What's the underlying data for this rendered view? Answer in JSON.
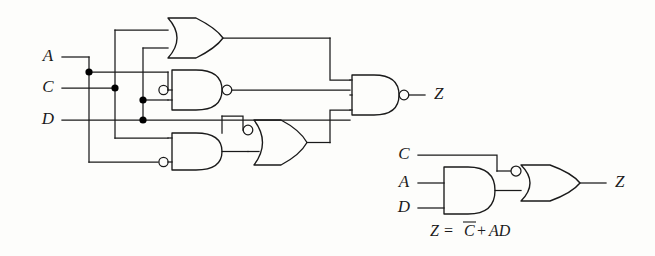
{
  "figure": {
    "kind": "logic-circuit-diagram",
    "background_color": "#fdfdfb",
    "line_color": "#1a1a1a",
    "width": 655,
    "height": 256
  },
  "left_circuit": {
    "name": "nand-nor-implementation",
    "inputs": [
      {
        "id": "A",
        "label": "A",
        "x": 48,
        "y": 57
      },
      {
        "id": "C",
        "label": "C",
        "x": 48,
        "y": 88
      },
      {
        "id": "D",
        "label": "D",
        "x": 48,
        "y": 120
      }
    ],
    "output": {
      "id": "Z",
      "label": "Z",
      "x": 432,
      "y": 95
    },
    "gates": [
      {
        "id": "g1",
        "type": "OR",
        "inputs": 2,
        "inverted_inputs": [],
        "inverted_output": false
      },
      {
        "id": "g2",
        "type": "AND",
        "inputs": 3,
        "inverted_inputs": [
          0
        ],
        "inverted_output": true
      },
      {
        "id": "g3",
        "type": "AND",
        "inputs": 2,
        "inverted_inputs": [
          1
        ],
        "inverted_output": false
      },
      {
        "id": "g4",
        "type": "OR",
        "inputs": 2,
        "inverted_inputs": [
          0
        ],
        "inverted_output": false
      },
      {
        "id": "g5",
        "type": "AND",
        "inputs": 3,
        "inverted_inputs": [],
        "inverted_output": true
      }
    ],
    "junction_count": 4
  },
  "right_circuit": {
    "name": "simplified-implementation",
    "inputs": [
      {
        "id": "C",
        "label": "C",
        "x": 404,
        "y": 155
      },
      {
        "id": "A",
        "label": "A",
        "x": 404,
        "y": 183
      },
      {
        "id": "D",
        "label": "D",
        "x": 404,
        "y": 208
      }
    ],
    "output": {
      "id": "Z",
      "label": "Z",
      "x": 620,
      "y": 183
    },
    "gates": [
      {
        "id": "h1",
        "type": "AND",
        "inputs": 2,
        "inverted_inputs": [],
        "inverted_output": false
      },
      {
        "id": "h2",
        "type": "OR",
        "inputs": 2,
        "inverted_inputs": [
          0
        ],
        "inverted_output": false
      }
    ]
  },
  "equation": {
    "lhs": "Z",
    "equals": "=",
    "term_bar": "C",
    "plus": "+",
    "term_product": "AD",
    "full_text": "Z = C̅+AD",
    "x": 430,
    "y": 232
  }
}
